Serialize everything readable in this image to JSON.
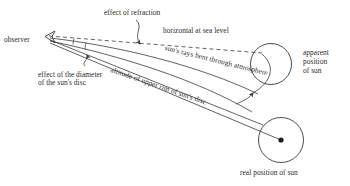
{
  "diagram": {
    "background_color": "#ffffff",
    "line_color": "#3a3a3a",
    "text_color": "#2b2b2b",
    "labels": {
      "observer": "observer",
      "effect_of_refraction": "effect of refraction",
      "horizontal_at_sea_level": "horizontal at sea level",
      "suns_rays_bent": "sun's rays bent through atmosphere",
      "altitude_upper_rim": "altitude of upper rim of sun's disc",
      "effect_of_diameter_line1": "effect of the diameter",
      "effect_of_diameter_line2": "of the sun's disc",
      "apparent_position_line1": "apparent",
      "apparent_position_line2": "position",
      "apparent_position_line3": "of sun",
      "real_position_of_sun": "real position of sun"
    },
    "elements": {
      "observer_marker": "observer-eye-marker",
      "apparent_sun_circle": "apparent-sun-circle",
      "real_sun_circle": "real-sun-circle",
      "real_sun_center_dot": "real-sun-center-dot",
      "horizon_dashed_line": "horizon-dashed-line",
      "refraction_leader_arrow": "refraction-leader-arrow",
      "diameter_leader_arrow": "diameter-leader-arrow",
      "atmosphere_leader_arrow": "atmosphere-leader-arrow"
    }
  }
}
